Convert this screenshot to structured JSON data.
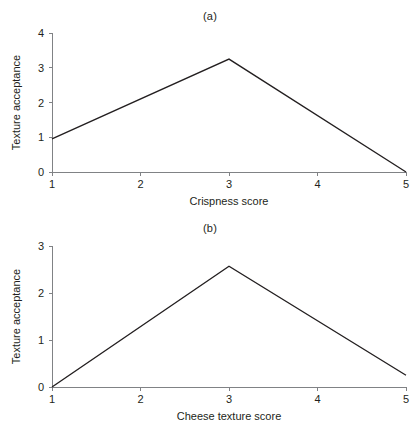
{
  "figure": {
    "background": "#ffffff",
    "line_color": "#231f20",
    "axis_color": "#808285",
    "text_color": "#231f20"
  },
  "panels": [
    {
      "id": "a",
      "title": "(a)",
      "xlabel": "Crispness score",
      "ylabel": "Texture acceptance",
      "xticks": [
        "1",
        "2",
        "3",
        "4",
        "5"
      ],
      "yticks": [
        "0",
        "1",
        "2",
        "3",
        "4"
      ]
    },
    {
      "id": "b",
      "title": "(b)",
      "xlabel": "Cheese texture score",
      "ylabel": "Texture acceptance",
      "xticks": [
        "1",
        "2",
        "3",
        "4",
        "5"
      ],
      "yticks": [
        "0",
        "1",
        "2",
        "3"
      ]
    }
  ],
  "chart_data": [
    {
      "type": "line",
      "panel": "(a)",
      "title": "(a)",
      "xlabel": "Crispness score",
      "ylabel": "Texture acceptance",
      "xlim": [
        1,
        5
      ],
      "ylim": [
        0,
        4
      ],
      "xticks": [
        1,
        2,
        3,
        4,
        5
      ],
      "yticks": [
        0,
        1,
        2,
        3,
        4
      ],
      "grid": false,
      "legend": null,
      "series": [
        {
          "name": "Texture acceptance vs crispness",
          "x": [
            1,
            3,
            5
          ],
          "y": [
            0.95,
            3.25,
            0.0
          ]
        }
      ]
    },
    {
      "type": "line",
      "panel": "(b)",
      "title": "(b)",
      "xlabel": "Cheese texture score",
      "ylabel": "Texture acceptance",
      "xlim": [
        1,
        5
      ],
      "ylim": [
        0,
        3
      ],
      "xticks": [
        1,
        2,
        3,
        4,
        5
      ],
      "yticks": [
        0,
        1,
        2,
        3
      ],
      "grid": false,
      "legend": null,
      "series": [
        {
          "name": "Texture acceptance vs cheese texture",
          "x": [
            1,
            3,
            5
          ],
          "y": [
            0.0,
            2.57,
            0.25
          ]
        }
      ]
    }
  ]
}
